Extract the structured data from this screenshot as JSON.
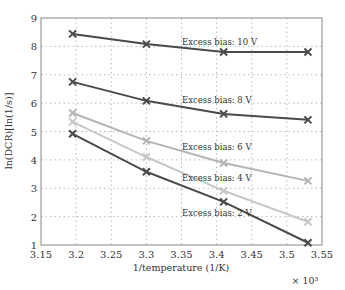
{
  "chart_data": {
    "type": "line",
    "title": "",
    "xlabel": "1/temperature (1/K)",
    "ylabel": "ln(DCR)[ln(1/s)]",
    "x_multiplier": "× 10³",
    "xlim": [
      3.15,
      3.55
    ],
    "ylim": [
      1,
      9
    ],
    "xticks": [
      "3.15",
      "3.2",
      "3.25",
      "3.3",
      "3.35",
      "3.4",
      "3.45",
      "3.5",
      "3.55"
    ],
    "yticks": [
      "1",
      "2",
      "3",
      "4",
      "5",
      "6",
      "7",
      "8",
      "9"
    ],
    "grid": true,
    "x": [
      3.195,
      3.3,
      3.41,
      3.53
    ],
    "series": [
      {
        "name": "Excess bias: 10 V",
        "values": [
          8.44,
          8.08,
          7.8,
          7.8
        ],
        "color": "#4a4a4a"
      },
      {
        "name": "Excess bias: 8 V",
        "values": [
          6.75,
          6.08,
          5.62,
          5.41
        ],
        "color": "#4a4a4a"
      },
      {
        "name": "Excess bias: 6 V",
        "values": [
          5.65,
          4.67,
          3.89,
          3.26
        ],
        "color": "#b5b5b5"
      },
      {
        "name": "Excess bias: 4 V",
        "values": [
          5.34,
          4.1,
          2.91,
          1.82
        ],
        "color": "#c8c8c8"
      },
      {
        "name": "Excess bias: 2 V",
        "values": [
          4.92,
          3.58,
          2.52,
          1.08
        ],
        "color": "#4a4a4a"
      }
    ],
    "annotations": [
      {
        "text": "Excess bias: 10 V",
        "x": 182,
        "y": 45
      },
      {
        "text": "Excess bias: 8 V",
        "x": 182,
        "y": 103
      },
      {
        "text": "Excess bias: 6 V",
        "x": 182,
        "y": 150
      },
      {
        "text": "Excess bias: 4 V",
        "x": 182,
        "y": 181
      },
      {
        "text": "Excess bias: 2 V",
        "x": 182,
        "y": 216
      }
    ]
  }
}
